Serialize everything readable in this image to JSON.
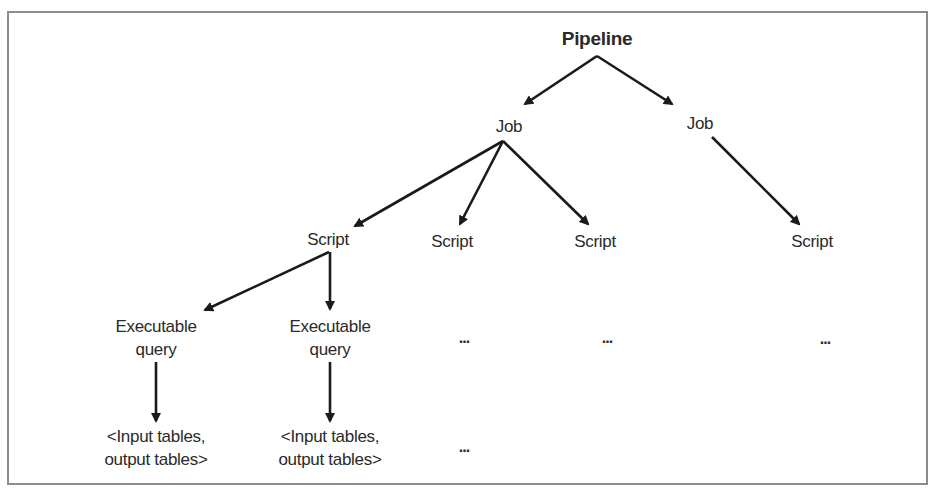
{
  "diagram": {
    "type": "tree",
    "root": {
      "label": "Pipeline"
    },
    "jobs": [
      {
        "label": "Job"
      },
      {
        "label": "Job"
      }
    ],
    "scripts": [
      {
        "label": "Script"
      },
      {
        "label": "Script"
      },
      {
        "label": "Script"
      },
      {
        "label": "Script"
      }
    ],
    "queries": [
      {
        "line1": "Executable",
        "line2": "query"
      },
      {
        "line1": "Executable",
        "line2": "query"
      }
    ],
    "tables": [
      {
        "line1": "<Input tables,",
        "line2": "output tables>"
      },
      {
        "line1": "<Input tables,",
        "line2": "output tables>"
      }
    ],
    "ellipsis": "..."
  },
  "colors": {
    "line": "#1a1a1a",
    "border": "#8c8c8c",
    "text": "#2a2a2a"
  }
}
